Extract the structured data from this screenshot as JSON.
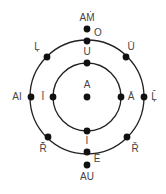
{
  "diagram": {
    "center": {
      "x": 87,
      "y": 97
    },
    "colors": {
      "stroke": "#222222",
      "dot": "#111111",
      "label": "#444444",
      "background": "#ffffff"
    },
    "circles": [
      {
        "name": "outer-circle",
        "r": 57
      },
      {
        "name": "inner-circle",
        "r": 34
      }
    ],
    "nodes": [
      {
        "id": "am",
        "label": "AṀ",
        "dot": {
          "x": 87,
          "y": 29
        },
        "labelPos": {
          "x": 87,
          "y": 18
        }
      },
      {
        "id": "o",
        "label": "O",
        "dot": {
          "x": 87,
          "y": 41
        },
        "labelPos": {
          "x": 98,
          "y": 33
        }
      },
      {
        "id": "u",
        "label": "U",
        "dot": {
          "x": 87,
          "y": 63
        },
        "labelPos": {
          "x": 87,
          "y": 52
        }
      },
      {
        "id": "a",
        "label": "A",
        "dot": {
          "x": 87,
          "y": 97
        },
        "labelPos": {
          "x": 87,
          "y": 85
        }
      },
      {
        "id": "i",
        "label": "I",
        "dot": {
          "x": 87,
          "y": 131
        },
        "labelPos": {
          "x": 87,
          "y": 141
        }
      },
      {
        "id": "e",
        "label": "Ē",
        "dot": {
          "x": 87,
          "y": 152
        },
        "labelPos": {
          "x": 97,
          "y": 159
        }
      },
      {
        "id": "au",
        "label": "AU",
        "dot": {
          "x": 87,
          "y": 165
        },
        "labelPos": {
          "x": 87,
          "y": 177
        }
      },
      {
        "id": "l-dot",
        "label": "Ļ",
        "dot": {
          "x": 47,
          "y": 57
        },
        "labelPos": {
          "x": 37,
          "y": 47
        }
      },
      {
        "id": "u-bar",
        "label": "Ū",
        "dot": {
          "x": 126,
          "y": 57
        },
        "labelPos": {
          "x": 131,
          "y": 47
        }
      },
      {
        "id": "ai",
        "label": "AI",
        "dot": {
          "x": 31,
          "y": 97
        },
        "labelPos": {
          "x": 17,
          "y": 97
        }
      },
      {
        "id": "i-bar",
        "label": "Ī",
        "dot": {
          "x": 53,
          "y": 97
        },
        "labelPos": {
          "x": 43,
          "y": 97
        }
      },
      {
        "id": "a-bar",
        "label": "Ā",
        "dot": {
          "x": 121,
          "y": 97
        },
        "labelPos": {
          "x": 131,
          "y": 97
        }
      },
      {
        "id": "l-bar",
        "label": "Ļ̄",
        "dot": {
          "x": 144,
          "y": 97
        },
        "labelPos": {
          "x": 154,
          "y": 97
        }
      },
      {
        "id": "r-bar",
        "label": "Ř̄",
        "dot": {
          "x": 48,
          "y": 137
        },
        "labelPos": {
          "x": 43,
          "y": 149
        }
      },
      {
        "id": "r-dot",
        "label": "Ř",
        "dot": {
          "x": 127,
          "y": 137
        },
        "labelPos": {
          "x": 135,
          "y": 149
        }
      }
    ]
  }
}
